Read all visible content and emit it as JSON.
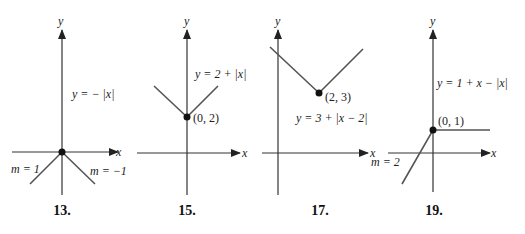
{
  "panels": [
    {
      "number": "13.",
      "axis_x": "x",
      "axis_y": "y",
      "equation": "y = − |x|",
      "labels": [
        "m = 1",
        "m = −1"
      ]
    },
    {
      "number": "15.",
      "axis_x": "x",
      "axis_y": "y",
      "equation": "y = 2 + |x|",
      "point": "(0, 2)"
    },
    {
      "number": "17.",
      "axis_x": "x",
      "axis_y": "y",
      "equation": "y = 3 + |x − 2|",
      "point": "(2, 3)"
    },
    {
      "number": "19.",
      "axis_x": "x",
      "axis_y": "y",
      "equation": "y = 1 + x − |x|",
      "point": "(0, 1)",
      "labels": [
        "m = 2"
      ]
    }
  ],
  "colors": {
    "line": "#555555",
    "axis": "#333333",
    "text": "#222222"
  }
}
